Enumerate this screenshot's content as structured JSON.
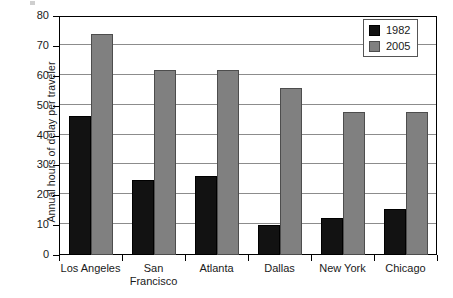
{
  "chart_data": {
    "type": "bar",
    "title": "",
    "subtitle": "",
    "xlabel": "",
    "ylabel": "Annual hours of delay per traveler",
    "ylim": [
      0,
      80
    ],
    "ytick_step": 10,
    "yticks": [
      0,
      10,
      20,
      30,
      40,
      50,
      60,
      70,
      80
    ],
    "grid": true,
    "grid_axis": "y",
    "legend_position": "top-right",
    "categories": [
      "Los Angeles",
      "San Francisco",
      "Atlanta",
      "Dallas",
      "New York",
      "Chicago"
    ],
    "category_lines": [
      [
        "Los Angeles"
      ],
      [
        "San",
        "Francisco"
      ],
      [
        "Atlanta"
      ],
      [
        "Dallas"
      ],
      [
        "New York"
      ],
      [
        "Chicago"
      ]
    ],
    "series": [
      {
        "name": "1982",
        "color": "#121212",
        "values": [
          46.5,
          25,
          26.5,
          10,
          12.5,
          15.5
        ]
      },
      {
        "name": "2005",
        "color": "#808080",
        "values": [
          74,
          62,
          62,
          56,
          48,
          48
        ]
      }
    ]
  },
  "legend": {
    "items": [
      {
        "label": "1982"
      },
      {
        "label": "2005"
      }
    ]
  }
}
